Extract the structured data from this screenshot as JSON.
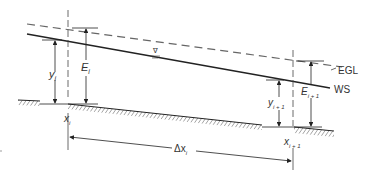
{
  "figure": {
    "line_color": "#222222",
    "dash_color": "#666666",
    "labels": {
      "egl": "EGL",
      "ws": "WS",
      "y_i": "y",
      "y_i_sub": "i",
      "e_i": "E",
      "e_i_sub": "i",
      "y_i1": "y",
      "y_i1_sub": "i + 1",
      "e_i1": "E",
      "e_i1_sub": "i + 1",
      "x_i": "x",
      "x_i_sub": "i",
      "x_i1": "x",
      "x_i1_sub": "i + 1",
      "dx": "Δx",
      "dx_sub": "i",
      "ws_symbol": "∇"
    }
  }
}
